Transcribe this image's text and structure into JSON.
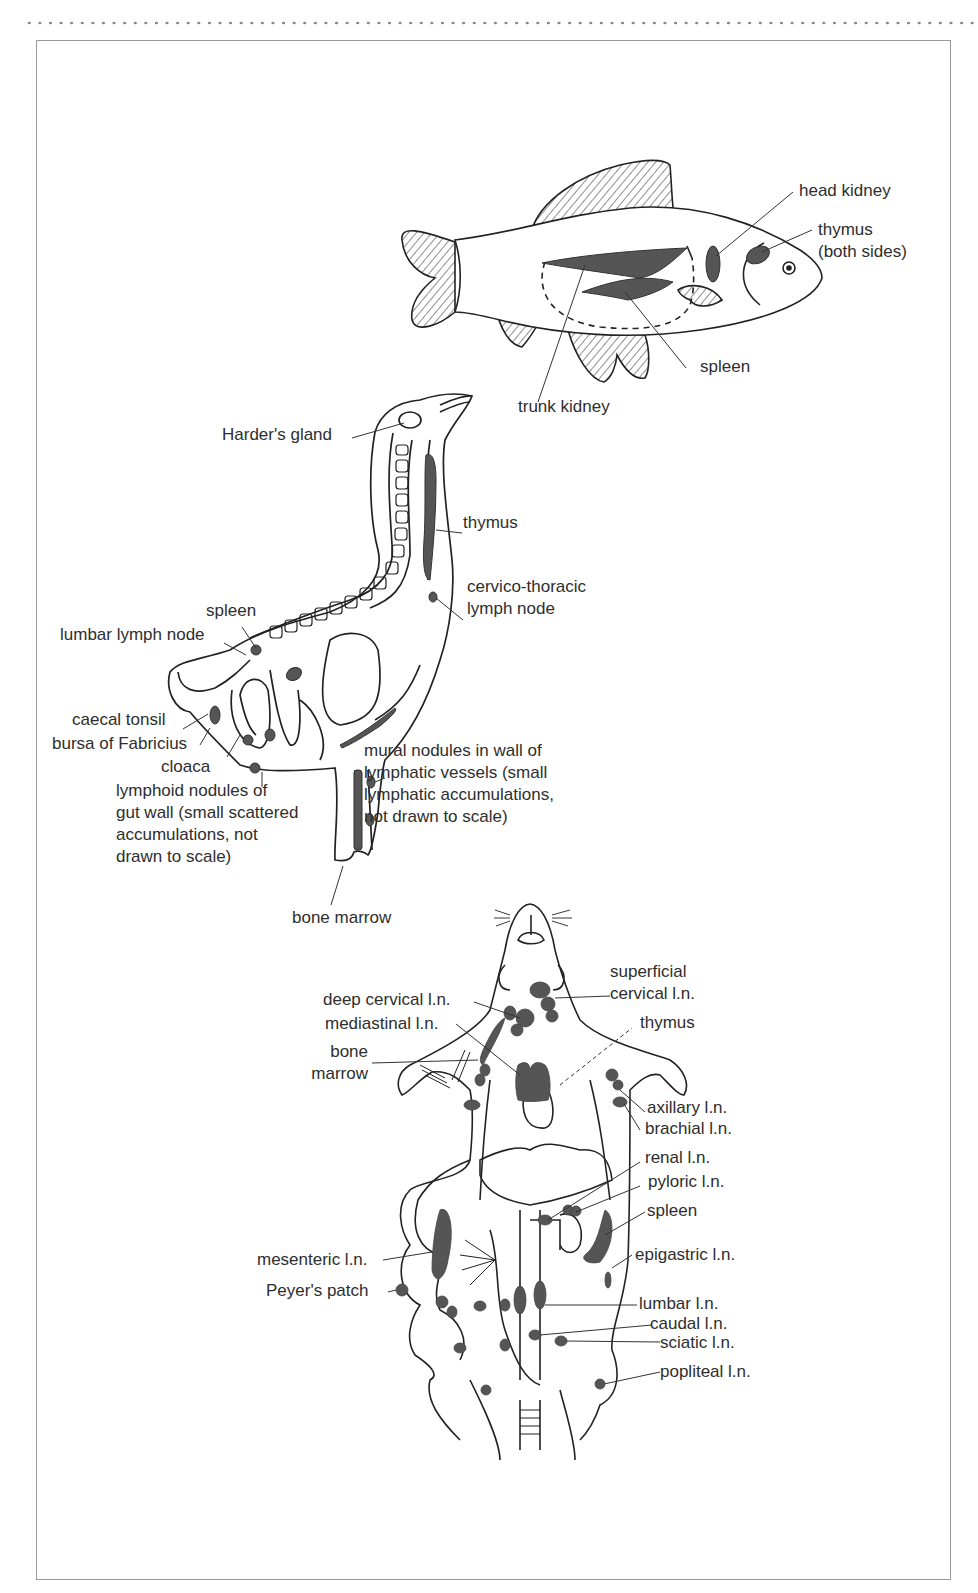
{
  "figure": {
    "ink_color": "#222222",
    "organ_fill": "#555555",
    "frame_color": "#9a9a9a"
  },
  "fish": {
    "labels": {
      "head_kidney": "head kidney",
      "thymus": "thymus\n(both sides)",
      "spleen": "spleen",
      "trunk_kidney": "trunk kidney"
    }
  },
  "bird": {
    "labels": {
      "harders_gland": "Harder's gland",
      "thymus": "thymus",
      "cervico_thoracic": "cervico-thoracic\nlymph node",
      "spleen": "spleen",
      "lumbar_lymph_node": "lumbar lymph node",
      "caecal_tonsil": "caecal tonsil",
      "bursa": "bursa of Fabricius",
      "cloaca": "cloaca",
      "lymphoid_nodules": "lymphoid nodules of\ngut wall (small scattered\naccumulations, not\ndrawn to scale)",
      "mural_nodules": "mural nodules in wall of\nlymphatic vessels (small\nlymphatic accumulations,\nnot drawn to scale)",
      "bone_marrow": "bone marrow"
    }
  },
  "mouse": {
    "labels": {
      "superficial_cervical": "superficial\ncervical l.n.",
      "deep_cervical": "deep cervical l.n.",
      "mediastinal": "mediastinal l.n.",
      "thymus": "thymus",
      "bone_marrow": "bone\nmarrow",
      "axillary": "axillary l.n.",
      "brachial": "brachial l.n.",
      "renal": "renal l.n.",
      "pyloric": "pyloric l.n.",
      "spleen": "spleen",
      "epigastric": "epigastric l.n.",
      "mesenteric": "mesenteric l.n.",
      "peyers_patch": "Peyer's patch",
      "lumbar": "lumbar l.n.",
      "caudal": "caudal l.n.",
      "sciatic": "sciatic l.n.",
      "popliteal": "popliteal l.n."
    }
  }
}
